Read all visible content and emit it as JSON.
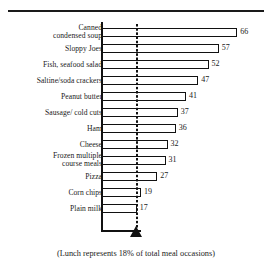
{
  "chart_data": {
    "type": "bar",
    "orientation": "horizontal",
    "title": "",
    "subtitle": "",
    "xlabel": "",
    "ylabel": "",
    "categories": [
      "Canned\ncondensed soup",
      "Sloppy Joes",
      "Fish, seafood  salad",
      "Saltine/soda crackers",
      "Peanut butter",
      "Sausage/ cold cuts",
      "Ham",
      "Cheese",
      "Frozen multiple\ncourse meals",
      "Pizza",
      "Corn chips",
      "Plain milk"
    ],
    "values": [
      66,
      57,
      52,
      47,
      41,
      37,
      36,
      32,
      31,
      27,
      19,
      17
    ],
    "data_labels": [
      "66",
      "57",
      "52",
      "47",
      "41",
      "37",
      "36",
      "32",
      "31",
      "27",
      "19",
      "17"
    ],
    "xlim": [
      0,
      66
    ],
    "grid": false,
    "legend": null,
    "annotations": [
      {
        "name": "reference-line",
        "type": "dotted-vertical-line-with-triangle-marker",
        "value": 17
      }
    ],
    "caption": "(Lunch represents 18% of total meal occasions)",
    "colors": {
      "bar_fill": "#ffffff",
      "bar_stroke": "#111111",
      "axis": "#111111",
      "text": "#1a1a1a",
      "reference_line": "#111111"
    }
  },
  "caption": {
    "text": "(Lunch represents 18% of total meal occasions)"
  }
}
